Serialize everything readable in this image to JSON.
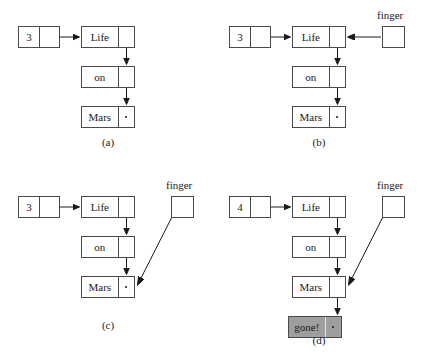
{
  "figure": {
    "background_color": "#ffffff",
    "line_color": "#1a1a1a",
    "box_border_color": "#4a4a4a",
    "shaded_fill_color": "#9e9e9e"
  },
  "panels": [
    {
      "id": "a",
      "label": "(a)",
      "count_node": {
        "value": "3",
        "pointer": ""
      },
      "list_nodes": [
        {
          "value": "Life",
          "pointer": "arrow-down"
        },
        {
          "value": "on",
          "pointer": "arrow-down"
        },
        {
          "value": "Mars",
          "pointer": "null-dot"
        }
      ],
      "finger": null
    },
    {
      "id": "b",
      "label": "(b)",
      "count_node": {
        "value": "3",
        "pointer": ""
      },
      "list_nodes": [
        {
          "value": "Life",
          "pointer": "arrow-down"
        },
        {
          "value": "on",
          "pointer": "arrow-down"
        },
        {
          "value": "Mars",
          "pointer": "null-dot"
        }
      ],
      "finger": {
        "label": "finger",
        "target": "Life",
        "arrow": "horizontal-left"
      }
    },
    {
      "id": "c",
      "label": "(c)",
      "count_node": {
        "value": "3",
        "pointer": ""
      },
      "list_nodes": [
        {
          "value": "Life",
          "pointer": "arrow-down"
        },
        {
          "value": "on",
          "pointer": "arrow-down"
        },
        {
          "value": "Mars",
          "pointer": "null-dot"
        }
      ],
      "finger": {
        "label": "finger",
        "target": "Mars",
        "arrow": "diagonal-down-left"
      }
    },
    {
      "id": "d",
      "label": "(d)",
      "count_node": {
        "value": "4",
        "pointer": ""
      },
      "list_nodes": [
        {
          "value": "Life",
          "pointer": "arrow-down"
        },
        {
          "value": "on",
          "pointer": "arrow-down"
        },
        {
          "value": "Mars",
          "pointer": "arrow-down"
        },
        {
          "value": "gone!",
          "pointer": "null-dot",
          "shaded": true
        }
      ],
      "finger": {
        "label": "finger",
        "target": "Mars",
        "arrow": "diagonal-down-left"
      }
    }
  ]
}
